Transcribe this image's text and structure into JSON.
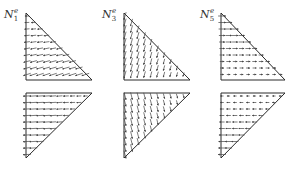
{
  "figure": {
    "stroke_color": "#2a2a2a",
    "arrow_color": "#444444",
    "background": "#ffffff"
  },
  "panels": [
    {
      "id": "N1",
      "label": {
        "base": "N",
        "sub": "1",
        "sup": "e"
      },
      "label_pos": [
        4,
        8
      ],
      "upper": {
        "vertices": [
          [
            26,
            13
          ],
          [
            26,
            80
          ],
          [
            92,
            80
          ]
        ],
        "field": "n1_upper"
      },
      "lower": {
        "vertices": [
          [
            26,
            93
          ],
          [
            92,
            93
          ],
          [
            26,
            158
          ]
        ],
        "field": "n1_lower"
      }
    },
    {
      "id": "N3",
      "label": {
        "base": "N",
        "sub": "3",
        "sup": "e"
      },
      "label_pos": [
        102,
        8
      ],
      "upper": {
        "vertices": [
          [
            124,
            13
          ],
          [
            124,
            80
          ],
          [
            190,
            80
          ]
        ],
        "field": "n3_upper"
      },
      "lower": {
        "vertices": [
          [
            124,
            93
          ],
          [
            190,
            93
          ],
          [
            124,
            158
          ]
        ],
        "field": "n3_lower"
      }
    },
    {
      "id": "N5",
      "label": {
        "base": "N",
        "sub": "5",
        "sup": "e"
      },
      "label_pos": [
        200,
        8
      ],
      "upper": {
        "vertices": [
          [
            221,
            13
          ],
          [
            221,
            80
          ],
          [
            285,
            80
          ]
        ],
        "field": "n5_upper"
      },
      "lower": {
        "vertices": [
          [
            221,
            93
          ],
          [
            285,
            93
          ],
          [
            221,
            158
          ]
        ],
        "field": "n5_lower"
      }
    }
  ]
}
